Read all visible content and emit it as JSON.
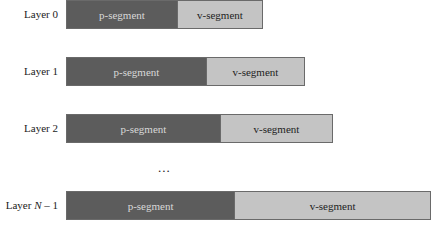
{
  "diagram": {
    "layers": [
      {
        "label": "Layer 0",
        "p_label": "p-segment",
        "v_label": "v-segment",
        "p_width": 111,
        "v_width": 86,
        "top": 0
      },
      {
        "label": "Layer 1",
        "p_label": "p-segment",
        "v_label": "v-segment",
        "p_width": 140,
        "v_width": 99,
        "top": 57
      },
      {
        "label": "Layer 2",
        "p_label": "p-segment",
        "v_label": "v-segment",
        "p_width": 154,
        "v_width": 113,
        "top": 114
      },
      {
        "label_prefix": "Layer ",
        "label_var": "N",
        "label_suffix": " – 1",
        "p_label": "p-segment",
        "v_label": "v-segment",
        "p_width": 168,
        "v_width": 197,
        "top": 191
      }
    ],
    "ellipsis": "...",
    "colors": {
      "p_segment": "#5c5c5c",
      "v_segment": "#c4c4c4",
      "border": "#6a6a6a"
    }
  }
}
